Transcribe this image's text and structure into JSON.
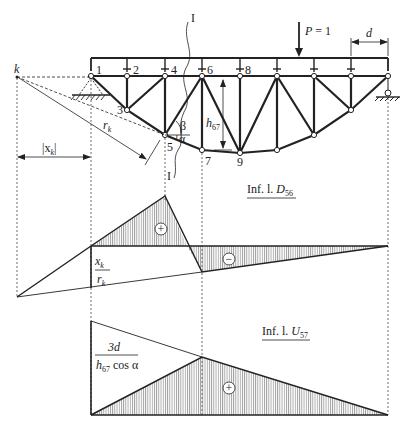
{
  "figure": {
    "type": "truss influence line diagram",
    "stroke_color": "#222222",
    "hatch_color": "#555555"
  },
  "truss": {
    "load_label": "P = 1",
    "panel_label": "d",
    "section_label_top": "I",
    "section_label_bottom": "I",
    "pole_label": "k",
    "distance_label": "|x",
    "distance_sub": "k",
    "distance_close": "|",
    "radius_label": "r",
    "radius_sub": "k",
    "height_label": "h",
    "height_sub": "67",
    "angle_beta": "β",
    "angle_alpha": "α",
    "nodes": {
      "n1": "1",
      "n2": "2",
      "n3": "3",
      "n4": "4",
      "n5": "5",
      "n6": "6",
      "n7": "7",
      "n8": "8",
      "n9": "9"
    }
  },
  "influence_D56": {
    "title_prefix": "Inf. l. ",
    "title_var": "D",
    "title_sub": "56",
    "ordinate_num": "x",
    "ordinate_num_sub": "k",
    "ordinate_den": "r",
    "ordinate_den_sub": "k",
    "positive_sign": "+",
    "negative_sign": "−"
  },
  "influence_U57": {
    "title_prefix": "Inf. l. ",
    "title_var": "U",
    "title_sub": "57",
    "ordinate_num": "3d",
    "ordinate_den_h": "h",
    "ordinate_den_sub": "67",
    "ordinate_den_rest": " cos α",
    "positive_sign": "+"
  }
}
